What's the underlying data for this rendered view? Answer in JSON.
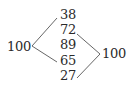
{
  "diagram": {
    "type": "bipartite-matching",
    "left_node": "100",
    "right_node": "100",
    "middle_nodes": [
      "38",
      "72",
      "89",
      "65",
      "27"
    ],
    "edges": [
      {
        "from": "left_node",
        "to": "38"
      },
      {
        "from": "left_node",
        "to": "65"
      },
      {
        "from": "72",
        "to": "right_node"
      },
      {
        "from": "27",
        "to": "right_node"
      }
    ],
    "line_color": "#555555",
    "text_color": "#2a2a2a"
  }
}
